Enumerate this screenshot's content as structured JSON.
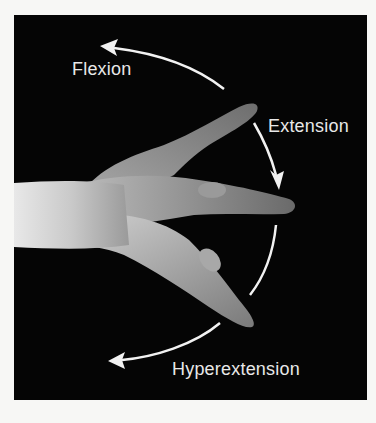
{
  "figure": {
    "labels": {
      "flexion": "Flexion",
      "extension": "Extension",
      "hyperextension": "Hyperextension"
    },
    "colors": {
      "background": "#050505",
      "page": "#f7f7f5",
      "arrow": "#f2f2f2",
      "text": "#e8e8e8"
    }
  }
}
